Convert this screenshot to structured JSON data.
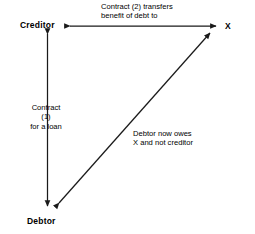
{
  "diagram": {
    "background_color": "#ffffff",
    "line_color": "#1a1a1a",
    "text_color": "#000000",
    "nodes": [
      {
        "id": "creditor",
        "label": "Creditor"
      },
      {
        "id": "x",
        "label": "X"
      },
      {
        "id": "debtor",
        "label": "Debtor"
      }
    ],
    "edges": [
      {
        "id": "creditor-x",
        "from": "Creditor",
        "to": "X",
        "arrows": "both",
        "label_line1": "Contract (2) transfers",
        "label_line2": "benefit of debt to"
      },
      {
        "id": "creditor-debtor",
        "from": "Creditor",
        "to": "Debtor",
        "arrows": "both",
        "label_line1": "Contract",
        "label_line2": "(1)",
        "label_line3": "for a loan"
      },
      {
        "id": "debtor-x",
        "from": "Debtor",
        "to": "X",
        "arrows": "both",
        "label_line1": "Debtor now owes",
        "label_line2": "X and not creditor"
      }
    ]
  }
}
